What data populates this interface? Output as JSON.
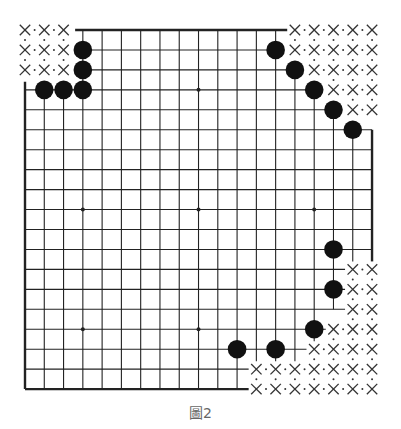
{
  "diagram": {
    "caption": "圖2",
    "board_size": 19,
    "colors": {
      "line": "#222222",
      "stone": "#111111",
      "mark": "#333333",
      "caption": "#666666"
    },
    "grid": {
      "origin_x": 25,
      "origin_y": 30,
      "step_x": 19.28,
      "step_y": 19.95,
      "stone_radius": 9.3
    },
    "star_points": [
      [
        3,
        3
      ],
      [
        9,
        3
      ],
      [
        3,
        9
      ],
      [
        9,
        9
      ],
      [
        15,
        9
      ],
      [
        3,
        15
      ],
      [
        9,
        15
      ]
    ],
    "black_stones": [
      [
        3,
        1
      ],
      [
        3,
        2
      ],
      [
        1,
        3
      ],
      [
        2,
        3
      ],
      [
        3,
        3
      ],
      [
        13,
        1
      ],
      [
        14,
        2
      ],
      [
        15,
        3
      ],
      [
        16,
        4
      ],
      [
        17,
        5
      ],
      [
        16,
        11
      ],
      [
        16,
        13
      ],
      [
        15,
        15
      ],
      [
        11,
        16
      ],
      [
        13,
        16
      ]
    ],
    "x_marks": [
      [
        0,
        0
      ],
      [
        1,
        0
      ],
      [
        2,
        0
      ],
      [
        0,
        1
      ],
      [
        1,
        1
      ],
      [
        2,
        1
      ],
      [
        0,
        2
      ],
      [
        1,
        2
      ],
      [
        2,
        2
      ],
      [
        14,
        0
      ],
      [
        15,
        0
      ],
      [
        16,
        0
      ],
      [
        17,
        0
      ],
      [
        18,
        0
      ],
      [
        14,
        1
      ],
      [
        15,
        1
      ],
      [
        16,
        1
      ],
      [
        17,
        1
      ],
      [
        18,
        1
      ],
      [
        15,
        2
      ],
      [
        16,
        2
      ],
      [
        17,
        2
      ],
      [
        18,
        2
      ],
      [
        16,
        3
      ],
      [
        17,
        3
      ],
      [
        18,
        3
      ],
      [
        17,
        4
      ],
      [
        18,
        4
      ],
      [
        17,
        12
      ],
      [
        18,
        12
      ],
      [
        17,
        13
      ],
      [
        18,
        13
      ],
      [
        17,
        14
      ],
      [
        18,
        14
      ],
      [
        16,
        15
      ],
      [
        17,
        15
      ],
      [
        18,
        15
      ],
      [
        15,
        16
      ],
      [
        16,
        16
      ],
      [
        17,
        16
      ],
      [
        18,
        16
      ],
      [
        12,
        17
      ],
      [
        13,
        17
      ],
      [
        14,
        17
      ],
      [
        15,
        17
      ],
      [
        16,
        17
      ],
      [
        17,
        17
      ],
      [
        18,
        17
      ],
      [
        12,
        18
      ],
      [
        13,
        18
      ],
      [
        14,
        18
      ],
      [
        15,
        18
      ],
      [
        16,
        18
      ],
      [
        17,
        18
      ],
      [
        18,
        18
      ]
    ],
    "h_lines": [
      {
        "row": 0,
        "from": 2.6,
        "to": 13.6,
        "edge": true
      },
      {
        "row": 1,
        "from": 3,
        "to": 13
      },
      {
        "row": 2,
        "from": 3,
        "to": 14
      },
      {
        "row": 3,
        "from": 0,
        "to": 15
      },
      {
        "row": 4,
        "from": 0,
        "to": 16
      },
      {
        "row": 5,
        "from": 0,
        "to": 18
      },
      {
        "row": 6,
        "from": 0,
        "to": 18
      },
      {
        "row": 7,
        "from": 0,
        "to": 18
      },
      {
        "row": 8,
        "from": 0,
        "to": 18
      },
      {
        "row": 9,
        "from": 0,
        "to": 18
      },
      {
        "row": 10,
        "from": 0,
        "to": 18
      },
      {
        "row": 11,
        "from": 0,
        "to": 18
      },
      {
        "row": 12,
        "from": 0,
        "to": 16.6
      },
      {
        "row": 13,
        "from": 0,
        "to": 16.6
      },
      {
        "row": 14,
        "from": 0,
        "to": 16.6
      },
      {
        "row": 15,
        "from": 0,
        "to": 15.6
      },
      {
        "row": 16,
        "from": 0,
        "to": 14.6
      },
      {
        "row": 17,
        "from": 0,
        "to": 11.6
      },
      {
        "row": 18,
        "from": 0,
        "to": 11.6,
        "edge": true
      }
    ],
    "v_lines": [
      {
        "col": 0,
        "from": 2.6,
        "to": 18,
        "edge": true
      },
      {
        "col": 1,
        "from": 3,
        "to": 18
      },
      {
        "col": 2,
        "from": 3,
        "to": 18
      },
      {
        "col": 3,
        "from": 0,
        "to": 18
      },
      {
        "col": 4,
        "from": 0,
        "to": 18
      },
      {
        "col": 5,
        "from": 0,
        "to": 18
      },
      {
        "col": 6,
        "from": 0,
        "to": 18
      },
      {
        "col": 7,
        "from": 0,
        "to": 18
      },
      {
        "col": 8,
        "from": 0,
        "to": 18
      },
      {
        "col": 9,
        "from": 0,
        "to": 18
      },
      {
        "col": 10,
        "from": 0,
        "to": 18
      },
      {
        "col": 11,
        "from": 0,
        "to": 18
      },
      {
        "col": 12,
        "from": 0,
        "to": 16.6
      },
      {
        "col": 13,
        "from": 0,
        "to": 16.6
      },
      {
        "col": 14,
        "from": 2,
        "to": 16.6
      },
      {
        "col": 15,
        "from": 3,
        "to": 15.6
      },
      {
        "col": 16,
        "from": 4,
        "to": 14
      },
      {
        "col": 17,
        "from": 5,
        "to": 11.6
      },
      {
        "col": 18,
        "from": 5,
        "to": 11.6,
        "edge": true
      }
    ]
  }
}
